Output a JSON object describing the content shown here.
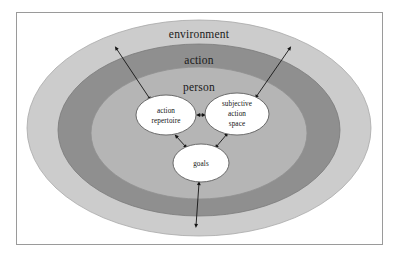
{
  "figure": {
    "frame": {
      "border_color": "#9a9a9a",
      "background": "#ffffff"
    }
  },
  "colors": {
    "outer_ring": "#cccccc",
    "middle_ring": "#8f8f8f",
    "inner_ring": "#b5b5b5",
    "node_fill": "#ffffff",
    "stroke": "#6e6e6e",
    "arrow": "#141414",
    "text": "#1a1a1a"
  },
  "rings": [
    {
      "id": "environment",
      "label": "environment",
      "level": 1,
      "fill": "#cccccc"
    },
    {
      "id": "action",
      "label": "action",
      "level": 2,
      "fill": "#8f8f8f"
    },
    {
      "id": "person",
      "label": "person",
      "level": 3,
      "fill": "#b5b5b5"
    }
  ],
  "nodes": [
    {
      "id": "action-repertoire",
      "lines": [
        "action",
        "repertoire"
      ],
      "cx": 166,
      "cy": 115,
      "rx": 30,
      "ry": 20
    },
    {
      "id": "subjective-action-space",
      "lines": [
        "subjective",
        "action",
        "space"
      ],
      "cx": 237,
      "cy": 114,
      "rx": 32,
      "ry": 21
    },
    {
      "id": "goals",
      "lines": [
        "goals"
      ],
      "cx": 201,
      "cy": 163,
      "rx": 28,
      "ry": 19
    }
  ],
  "connectors": [
    {
      "id": "repertoire-to-space",
      "from": "action-repertoire",
      "to": "subjective-action-space",
      "style": "double-arrow"
    },
    {
      "id": "repertoire-to-goals",
      "from": "action-repertoire",
      "to": "goals",
      "style": "double-arrow"
    },
    {
      "id": "space-to-goals",
      "from": "subjective-action-space",
      "to": "goals",
      "style": "double-arrow"
    },
    {
      "id": "environment-to-repertoire",
      "from": "environment",
      "to": "action-repertoire",
      "style": "double-arrow"
    },
    {
      "id": "environment-to-space",
      "from": "environment",
      "to": "subjective-action-space",
      "style": "double-arrow"
    },
    {
      "id": "environment-to-goals",
      "from": "environment",
      "to": "goals",
      "style": "double-arrow"
    }
  ]
}
